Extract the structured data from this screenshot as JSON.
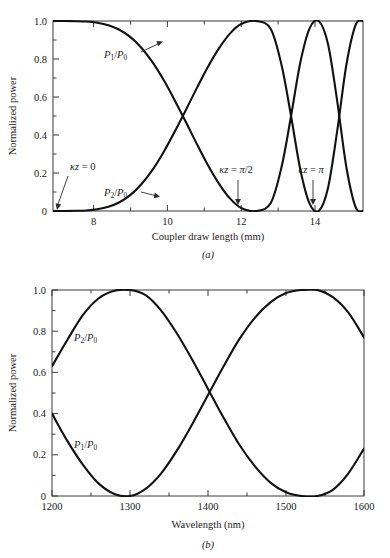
{
  "figure": {
    "panels": [
      {
        "id": "a",
        "caption": "(a)",
        "ylabel": "Normalized power",
        "xlabel": "Coupler draw length (mm)",
        "xticks": [
          "8",
          "10",
          "12",
          "14"
        ],
        "xtick_values": [
          8,
          10,
          12,
          14
        ],
        "yticks": [
          "0",
          "0.2",
          "0.4",
          "0.6",
          "0.8",
          "1.0"
        ],
        "ytick_values": [
          0,
          0.2,
          0.4,
          0.6,
          0.8,
          1.0
        ],
        "annotations": [
          {
            "name": "kz-zero",
            "text": "κz = 0",
            "arrow": "down-left"
          },
          {
            "name": "p1-label",
            "text": "P₁/P₀",
            "arrow": "up-right"
          },
          {
            "name": "p2-label",
            "text": "P₂/P₀",
            "arrow": "right"
          },
          {
            "name": "kz-pi-over-2",
            "text": "κz = π/2",
            "arrow": "down"
          },
          {
            "name": "kz-pi",
            "text": "κz = π",
            "arrow": "down"
          }
        ]
      },
      {
        "id": "b",
        "caption": "(b)",
        "ylabel": "Normalized power",
        "xlabel": "Wavelength (nm)",
        "xticks": [
          "1200",
          "1300",
          "1400",
          "1500",
          "1600"
        ],
        "xtick_values": [
          1200,
          1300,
          1400,
          1500,
          1600
        ],
        "yticks": [
          "0",
          "0.2",
          "0.4",
          "0.6",
          "0.8",
          "1.0"
        ],
        "ytick_values": [
          0,
          0.2,
          0.4,
          0.6,
          0.8,
          1.0
        ],
        "annotations": [
          {
            "name": "p2-label",
            "text": "P₂/P₀",
            "arrow": "none"
          },
          {
            "name": "p1-label",
            "text": "P₁/P₀",
            "arrow": "none"
          }
        ]
      }
    ]
  },
  "chart_data": [
    {
      "type": "line",
      "id": "a",
      "title": "",
      "xlabel": "Coupler draw length (mm)",
      "ylabel": "Normalized power",
      "xlim": [
        6.9,
        15.3
      ],
      "ylim": [
        0,
        1.0
      ],
      "grid": false,
      "legend": "none",
      "xticks": [
        8,
        10,
        12,
        14
      ],
      "yticks": [
        0,
        0.2,
        0.4,
        0.6,
        0.8,
        1.0
      ],
      "annotations": [
        {
          "text": "κz = 0",
          "x": 7.0,
          "y": 0.0
        },
        {
          "text": "κz = π/2",
          "x": 12.4,
          "y": 0.0
        },
        {
          "text": "κz = π",
          "x": 14.1,
          "y": 0.0
        }
      ],
      "series": [
        {
          "name": "P1/P0",
          "x": [
            6.9,
            7.2,
            7.5,
            7.8,
            8.1,
            8.4,
            8.7,
            9.0,
            9.3,
            9.6,
            9.9,
            10.2,
            10.5,
            10.8,
            11.1,
            11.4,
            11.7,
            12.0,
            12.4,
            12.8,
            13.1,
            13.35,
            13.6,
            13.85,
            14.1,
            14.35,
            14.6,
            14.85,
            15.1,
            15.3
          ],
          "y": [
            1.0,
            1.0,
            0.999,
            0.997,
            0.991,
            0.978,
            0.954,
            0.915,
            0.858,
            0.782,
            0.689,
            0.582,
            0.468,
            0.352,
            0.241,
            0.143,
            0.065,
            0.016,
            0.0,
            0.042,
            0.238,
            0.5,
            0.78,
            0.96,
            1.0,
            0.88,
            0.58,
            0.23,
            0.02,
            0.0
          ]
        },
        {
          "name": "P2/P0",
          "x": [
            6.9,
            7.2,
            7.5,
            7.8,
            8.1,
            8.4,
            8.7,
            9.0,
            9.3,
            9.6,
            9.9,
            10.2,
            10.5,
            10.8,
            11.1,
            11.4,
            11.7,
            12.0,
            12.4,
            12.8,
            13.1,
            13.35,
            13.6,
            13.85,
            14.1,
            14.35,
            14.6,
            14.85,
            15.1,
            15.3
          ],
          "y": [
            0.0,
            0.0,
            0.001,
            0.003,
            0.009,
            0.022,
            0.046,
            0.085,
            0.142,
            0.218,
            0.311,
            0.418,
            0.532,
            0.648,
            0.759,
            0.857,
            0.935,
            0.984,
            1.0,
            0.958,
            0.762,
            0.5,
            0.22,
            0.04,
            0.0,
            0.12,
            0.42,
            0.77,
            0.98,
            1.0
          ]
        }
      ]
    },
    {
      "type": "line",
      "id": "b",
      "title": "",
      "xlabel": "Wavelength (nm)",
      "ylabel": "Normalized power",
      "xlim": [
        1200,
        1600
      ],
      "ylim": [
        0,
        1.0
      ],
      "grid": false,
      "legend": "none",
      "xticks": [
        1200,
        1300,
        1400,
        1500,
        1600
      ],
      "yticks": [
        0,
        0.2,
        0.4,
        0.6,
        0.8,
        1.0
      ],
      "series": [
        {
          "name": "P2/P0",
          "x": [
            1200,
            1220,
            1240,
            1260,
            1280,
            1300,
            1320,
            1340,
            1360,
            1380,
            1400,
            1420,
            1440,
            1460,
            1480,
            1500,
            1520,
            1540,
            1560,
            1580,
            1600
          ],
          "y": [
            0.63,
            0.76,
            0.88,
            0.96,
            0.996,
            1.0,
            0.975,
            0.9,
            0.79,
            0.66,
            0.52,
            0.38,
            0.25,
            0.145,
            0.065,
            0.018,
            0.0,
            0.0,
            0.03,
            0.11,
            0.23
          ]
        },
        {
          "name": "P1/P0",
          "x": [
            1200,
            1220,
            1240,
            1260,
            1280,
            1300,
            1320,
            1340,
            1360,
            1380,
            1400,
            1420,
            1440,
            1460,
            1480,
            1500,
            1520,
            1540,
            1560,
            1580,
            1600
          ],
          "y": [
            0.4,
            0.265,
            0.15,
            0.06,
            0.01,
            0.0,
            0.035,
            0.11,
            0.22,
            0.35,
            0.49,
            0.63,
            0.76,
            0.865,
            0.94,
            0.985,
            1.0,
            1.0,
            0.965,
            0.89,
            0.77
          ]
        }
      ]
    }
  ]
}
